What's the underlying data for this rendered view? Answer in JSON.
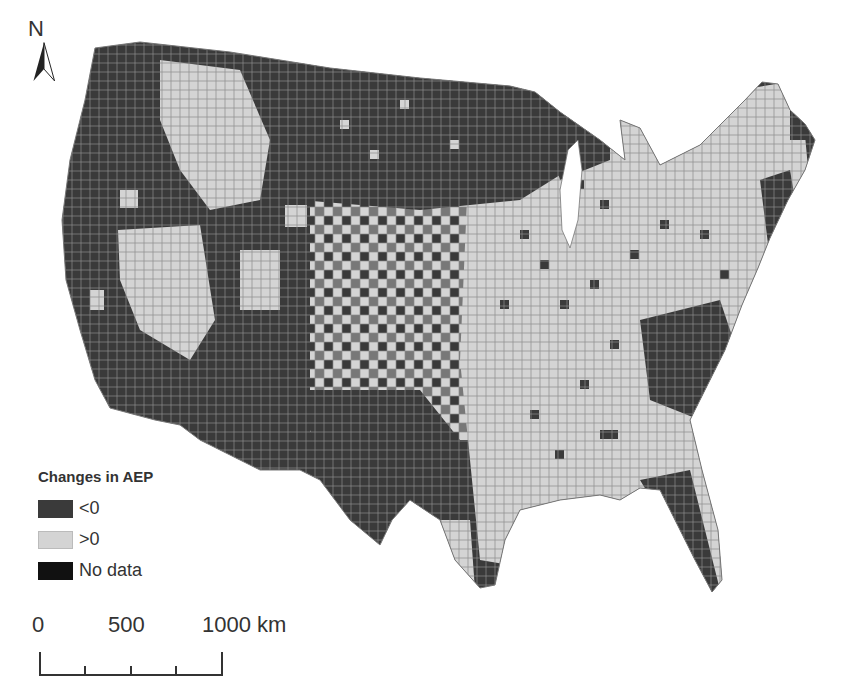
{
  "north_arrow": {
    "label": "N"
  },
  "legend": {
    "title": "Changes in AEP",
    "items": [
      {
        "label": "<0",
        "color": "#3a3a3a"
      },
      {
        "label": ">0",
        "color": "#d4d4d4"
      },
      {
        "label": "No data",
        "color": "#111111"
      }
    ]
  },
  "scale_bar": {
    "ticks": [
      "0",
      "500",
      "1000 km"
    ]
  },
  "colors": {
    "negative": "#3a3a3a",
    "positive": "#d4d4d4",
    "county_border": "#8a8a8a",
    "no_data": "#111111"
  },
  "map": {
    "subject": "Contiguous United States counties",
    "variable": "Changes in AEP"
  }
}
